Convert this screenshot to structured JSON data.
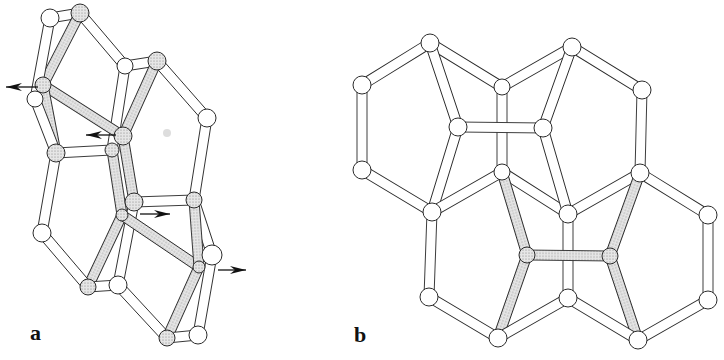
{
  "figure": {
    "panels": [
      {
        "id": "a",
        "label": "a",
        "label_pos": [
          30,
          322
        ],
        "nodes": [
          {
            "id": "a1",
            "x": 50,
            "y": 18,
            "r": 9,
            "dotted": false
          },
          {
            "id": "a2",
            "x": 80,
            "y": 13,
            "r": 9,
            "dotted": true
          },
          {
            "id": "a3",
            "x": 125,
            "y": 66,
            "r": 8,
            "dotted": false
          },
          {
            "id": "a4",
            "x": 157,
            "y": 61,
            "r": 9,
            "dotted": true
          },
          {
            "id": "a5",
            "x": 43,
            "y": 85,
            "r": 8,
            "dotted": true
          },
          {
            "id": "a6",
            "x": 35,
            "y": 99,
            "r": 8,
            "dotted": false
          },
          {
            "id": "a7",
            "x": 123,
            "y": 136,
            "r": 9,
            "dotted": true
          },
          {
            "id": "a8",
            "x": 112,
            "y": 150,
            "r": 7,
            "dotted": true
          },
          {
            "id": "a9",
            "x": 56,
            "y": 153,
            "r": 9,
            "dotted": true
          },
          {
            "id": "a10",
            "x": 207,
            "y": 118,
            "r": 9,
            "dotted": false
          },
          {
            "id": "a11",
            "x": 134,
            "y": 202,
            "r": 9,
            "dotted": true
          },
          {
            "id": "a12",
            "x": 122,
            "y": 215,
            "r": 6,
            "dotted": true
          },
          {
            "id": "a13",
            "x": 194,
            "y": 200,
            "r": 8,
            "dotted": true
          },
          {
            "id": "a14",
            "x": 42,
            "y": 233,
            "r": 9,
            "dotted": false
          },
          {
            "id": "a15",
            "x": 212,
            "y": 255,
            "r": 10,
            "dotted": false
          },
          {
            "id": "a16",
            "x": 199,
            "y": 267,
            "r": 6,
            "dotted": true
          },
          {
            "id": "a17",
            "x": 88,
            "y": 287,
            "r": 8,
            "dotted": true
          },
          {
            "id": "a18",
            "x": 118,
            "y": 285,
            "r": 9,
            "dotted": false
          },
          {
            "id": "a19",
            "x": 167,
            "y": 338,
            "r": 8,
            "dotted": true
          },
          {
            "id": "a20",
            "x": 198,
            "y": 335,
            "r": 9,
            "dotted": false
          }
        ],
        "bonds": [
          {
            "from": "a1",
            "to": "a2",
            "dotted": false
          },
          {
            "from": "a2",
            "to": "a3",
            "dotted": false
          },
          {
            "from": "a2",
            "to": "a5",
            "dotted": true
          },
          {
            "from": "a1",
            "to": "a6",
            "dotted": false
          },
          {
            "from": "a3",
            "to": "a4",
            "dotted": false
          },
          {
            "from": "a3",
            "to": "a8",
            "dotted": false
          },
          {
            "from": "a4",
            "to": "a7",
            "dotted": true
          },
          {
            "from": "a4",
            "to": "a10",
            "dotted": false
          },
          {
            "from": "a5",
            "to": "a7",
            "dotted": true
          },
          {
            "from": "a5",
            "to": "a9",
            "dotted": true
          },
          {
            "from": "a6",
            "to": "a9",
            "dotted": false
          },
          {
            "from": "a9",
            "to": "a8",
            "dotted": false
          },
          {
            "from": "a9",
            "to": "a14",
            "dotted": false
          },
          {
            "from": "a7",
            "to": "a11",
            "dotted": true
          },
          {
            "from": "a8",
            "to": "a12",
            "dotted": true
          },
          {
            "from": "a10",
            "to": "a13",
            "dotted": false
          },
          {
            "from": "a11",
            "to": "a13",
            "dotted": false
          },
          {
            "from": "a11",
            "to": "a18",
            "dotted": false
          },
          {
            "from": "a12",
            "to": "a17",
            "dotted": true
          },
          {
            "from": "a12",
            "to": "a16",
            "dotted": true
          },
          {
            "from": "a13",
            "to": "a15",
            "dotted": false
          },
          {
            "from": "a13",
            "to": "a16",
            "dotted": true
          },
          {
            "from": "a14",
            "to": "a17",
            "dotted": false
          },
          {
            "from": "a17",
            "to": "a18",
            "dotted": false
          },
          {
            "from": "a18",
            "to": "a19",
            "dotted": false
          },
          {
            "from": "a16",
            "to": "a19",
            "dotted": true
          },
          {
            "from": "a15",
            "to": "a20",
            "dotted": false
          },
          {
            "from": "a19",
            "to": "a20",
            "dotted": false
          }
        ],
        "arrows": [
          {
            "x1": 38,
            "y1": 87,
            "x2": 6,
            "y2": 87
          },
          {
            "x1": 116,
            "y1": 135,
            "x2": 86,
            "y2": 135
          },
          {
            "x1": 140,
            "y1": 214,
            "x2": 170,
            "y2": 214
          },
          {
            "x1": 218,
            "y1": 270,
            "x2": 246,
            "y2": 270
          }
        ],
        "blob": {
          "x": 167,
          "y": 133,
          "r": 4
        }
      },
      {
        "id": "b",
        "label": "b",
        "label_pos": [
          354,
          324
        ],
        "nodes": [
          {
            "id": "b1",
            "x": 430,
            "y": 43,
            "r": 9,
            "dotted": false
          },
          {
            "id": "b2",
            "x": 502,
            "y": 87,
            "r": 8,
            "dotted": false
          },
          {
            "id": "b3",
            "x": 572,
            "y": 47,
            "r": 9,
            "dotted": false
          },
          {
            "id": "b4",
            "x": 362,
            "y": 85,
            "r": 9,
            "dotted": false
          },
          {
            "id": "b5",
            "x": 642,
            "y": 90,
            "r": 9,
            "dotted": false
          },
          {
            "id": "b6",
            "x": 458,
            "y": 127,
            "r": 9,
            "dotted": false
          },
          {
            "id": "b7",
            "x": 543,
            "y": 128,
            "r": 9,
            "dotted": false
          },
          {
            "id": "b8",
            "x": 362,
            "y": 170,
            "r": 9,
            "dotted": false
          },
          {
            "id": "b9",
            "x": 502,
            "y": 172,
            "r": 8,
            "dotted": false
          },
          {
            "id": "b10",
            "x": 640,
            "y": 173,
            "r": 9,
            "dotted": false
          },
          {
            "id": "b11",
            "x": 432,
            "y": 212,
            "r": 9,
            "dotted": false
          },
          {
            "id": "b12",
            "x": 568,
            "y": 214,
            "r": 9,
            "dotted": false
          },
          {
            "id": "b13",
            "x": 708,
            "y": 215,
            "r": 9,
            "dotted": false
          },
          {
            "id": "b14",
            "x": 527,
            "y": 255,
            "r": 8,
            "dotted": true
          },
          {
            "id": "b15",
            "x": 610,
            "y": 256,
            "r": 8,
            "dotted": true
          },
          {
            "id": "b16",
            "x": 429,
            "y": 297,
            "r": 9,
            "dotted": false
          },
          {
            "id": "b17",
            "x": 568,
            "y": 298,
            "r": 9,
            "dotted": false
          },
          {
            "id": "b18",
            "x": 708,
            "y": 300,
            "r": 9,
            "dotted": false
          },
          {
            "id": "b19",
            "x": 498,
            "y": 338,
            "r": 9,
            "dotted": false
          },
          {
            "id": "b20",
            "x": 638,
            "y": 340,
            "r": 9,
            "dotted": false
          }
        ],
        "bonds": [
          {
            "from": "b1",
            "to": "b2",
            "dotted": false
          },
          {
            "from": "b2",
            "to": "b3",
            "dotted": false
          },
          {
            "from": "b1",
            "to": "b4",
            "dotted": false
          },
          {
            "from": "b3",
            "to": "b5",
            "dotted": false
          },
          {
            "from": "b1",
            "to": "b6",
            "dotted": false
          },
          {
            "from": "b3",
            "to": "b7",
            "dotted": false
          },
          {
            "from": "b4",
            "to": "b8",
            "dotted": false
          },
          {
            "from": "b5",
            "to": "b10",
            "dotted": false
          },
          {
            "from": "b2",
            "to": "b9",
            "dotted": false
          },
          {
            "from": "b6",
            "to": "b7",
            "dotted": false
          },
          {
            "from": "b8",
            "to": "b11",
            "dotted": false
          },
          {
            "from": "b6",
            "to": "b11",
            "dotted": false
          },
          {
            "from": "b9",
            "to": "b11",
            "dotted": false
          },
          {
            "from": "b9",
            "to": "b12",
            "dotted": false
          },
          {
            "from": "b7",
            "to": "b12",
            "dotted": false
          },
          {
            "from": "b12",
            "to": "b10",
            "dotted": false
          },
          {
            "from": "b10",
            "to": "b13",
            "dotted": false
          },
          {
            "from": "b13",
            "to": "b18",
            "dotted": false
          },
          {
            "from": "b11",
            "to": "b16",
            "dotted": false
          },
          {
            "from": "b12",
            "to": "b17",
            "dotted": false
          },
          {
            "from": "b9",
            "to": "b14",
            "dotted": true
          },
          {
            "from": "b10",
            "to": "b15",
            "dotted": true
          },
          {
            "from": "b14",
            "to": "b15",
            "dotted": true
          },
          {
            "from": "b14",
            "to": "b19",
            "dotted": true
          },
          {
            "from": "b15",
            "to": "b20",
            "dotted": true
          },
          {
            "from": "b16",
            "to": "b19",
            "dotted": false
          },
          {
            "from": "b19",
            "to": "b17",
            "dotted": false
          },
          {
            "from": "b17",
            "to": "b20",
            "dotted": false
          },
          {
            "from": "b20",
            "to": "b18",
            "dotted": false
          }
        ],
        "arrows": []
      }
    ],
    "style": {
      "stroke": "#2a2a2a",
      "fill_white": "#ffffff",
      "fill_dotted": "#d9d9d9",
      "dot_color": "#8a8a8a",
      "blob_color": "#cfcfcf",
      "bond_width": 10
    }
  }
}
